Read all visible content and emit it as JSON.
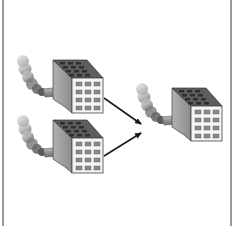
{
  "diagram": {
    "type": "merger-illustration",
    "nodes": [
      {
        "id": "factory-source-top",
        "icon": "factory-icon",
        "role": "source"
      },
      {
        "id": "factory-source-bottom",
        "icon": "factory-icon",
        "role": "source"
      },
      {
        "id": "factory-target",
        "icon": "factory-icon",
        "role": "target"
      }
    ],
    "edges": [
      {
        "from": "factory-source-top",
        "to": "factory-target",
        "icon": "arrow-icon"
      },
      {
        "from": "factory-source-bottom",
        "to": "factory-target",
        "icon": "arrow-icon"
      }
    ],
    "colors": {
      "frame_border": "#9a9a9a",
      "building_front": "#f2f2f2",
      "building_side": "#9c9c9c",
      "roof": "#6e6e6e",
      "window": "#7a7a7a",
      "smoke": "#8a8a8a",
      "arrow": "#1a1a1a"
    }
  }
}
